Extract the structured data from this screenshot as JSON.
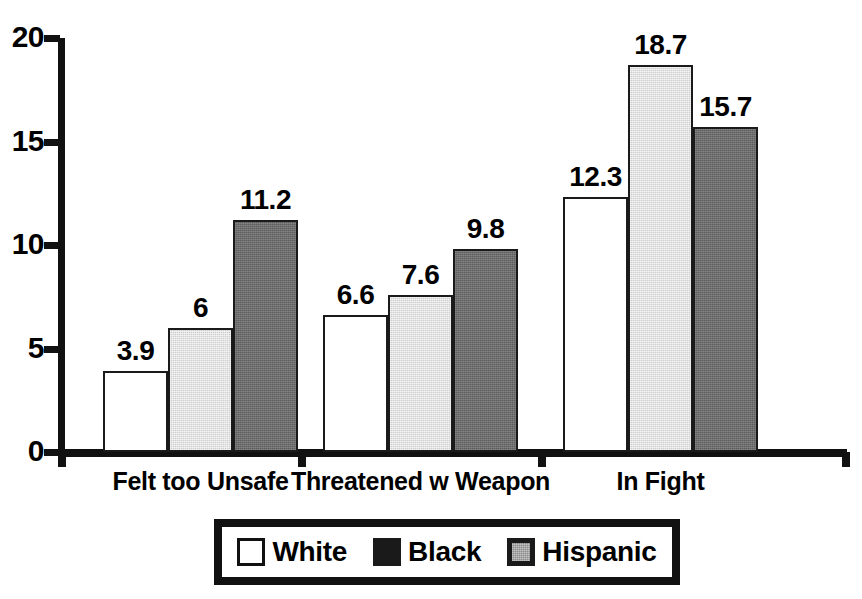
{
  "chart_data": {
    "type": "bar",
    "title": "",
    "subtitle": "",
    "xlabel": "",
    "ylabel": "",
    "ylim": [
      0,
      20
    ],
    "yticks": [
      "0",
      "5",
      "10",
      "15",
      "20"
    ],
    "ytick_values": [
      0,
      5,
      10,
      15,
      20
    ],
    "grid": false,
    "legend_position": "bottom",
    "categories": [
      "Felt too Unsafe",
      "Threatened w Weapon",
      "In Fight"
    ],
    "series": [
      {
        "name": "White",
        "values": [
          3.9,
          6.6,
          12.3
        ],
        "labels": [
          "3.9",
          "6.6",
          "12.3"
        ],
        "color": "#ffffff"
      },
      {
        "name": "Black",
        "values": [
          6,
          7.6,
          18.7
        ],
        "labels": [
          "6",
          "7.6",
          "18.7"
        ],
        "color": "#cfcfcf"
      },
      {
        "name": "Hispanic",
        "values": [
          11.2,
          9.8,
          15.7
        ],
        "labels": [
          "11.2",
          "9.8",
          "15.7"
        ],
        "color": "#5e5e5e"
      }
    ]
  },
  "axis": {
    "y_tick_labels": [
      "20",
      "15",
      "10",
      "5",
      "0"
    ]
  },
  "legend": {
    "items": [
      {
        "label": "White",
        "swatch": "white-square-icon"
      },
      {
        "label": "Black",
        "swatch": "black-square-icon"
      },
      {
        "label": "Hispanic",
        "swatch": "gray-square-icon"
      }
    ]
  },
  "colors": {
    "axis": "#111111",
    "white_series": "#ffffff",
    "black_series": "#cfcfcf",
    "hispanic_series": "#5e5e5e",
    "text": "#000000",
    "background": "#ffffff"
  }
}
